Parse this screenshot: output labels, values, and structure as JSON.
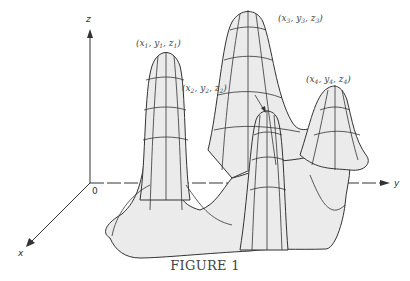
{
  "figure": {
    "caption": "FIGURE 1",
    "axes": {
      "z": "z",
      "y": "y",
      "x": "x",
      "origin": "0"
    },
    "points": [
      {
        "label": "(x",
        "x": "x",
        "y": "y",
        "z": "z",
        "sub": "1"
      },
      {
        "label": "(x2, y2, z2)",
        "sub": "2"
      },
      {
        "label": "(x3, y3, z3)",
        "sub": "3"
      },
      {
        "label": "(x4, y4, z4)",
        "sub": "4"
      }
    ],
    "surface_fill": "#ebebeb",
    "line_color": "#333333"
  }
}
